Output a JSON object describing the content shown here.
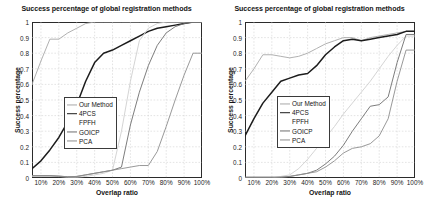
{
  "figure": {
    "panel_count": 2,
    "background_color": "#ffffff"
  },
  "axis": {
    "y_ticks": [
      "0",
      "0.1",
      "0.2",
      "0.3",
      "0.4",
      "0.5",
      "0.6",
      "0.7",
      "0.8",
      "0.9",
      "1"
    ],
    "x_ticks": [
      "10%",
      "20%",
      "30%",
      "40%",
      "50%",
      "60%",
      "70%",
      "80%",
      "90%",
      "100%"
    ],
    "ylabel": "Success percentage",
    "xlabel": "Overlap ratio"
  },
  "legend": {
    "entries": [
      {
        "label": "Our Method",
        "color": "#a8a8a8",
        "width": 1.1,
        "show_line": true
      },
      {
        "label": "4PCS",
        "color": "#1c1c1c",
        "width": 1.6,
        "show_line": true
      },
      {
        "label": "FPFH",
        "color": "#cfcfcf",
        "width": 1.1,
        "show_line": false
      },
      {
        "label": "GOICP",
        "color": "#6e6e6e",
        "width": 1.1,
        "show_line": true
      },
      {
        "label": "PCA",
        "color": "#8d8d8d",
        "width": 1.1,
        "show_line": true
      }
    ]
  },
  "chart_data": [
    {
      "type": "line",
      "panel": "left",
      "title": "Success percentage of global registration methods",
      "xlabel": "Overlap ratio",
      "ylabel": "Success percentage",
      "xlim": [
        5,
        100
      ],
      "ylim": [
        0,
        1
      ],
      "x": [
        5,
        10,
        15,
        20,
        25,
        30,
        35,
        40,
        45,
        50,
        55,
        60,
        65,
        70,
        75,
        80,
        85,
        90,
        95,
        100
      ],
      "grid": true,
      "legend_position": "center-left",
      "series": [
        {
          "name": "Our Method",
          "color": "#a8a8a8",
          "values": [
            0.6,
            0.75,
            0.89,
            0.89,
            0.93,
            0.96,
            0.99,
            1.0,
            1.0,
            1.0,
            1.0,
            1.0,
            1.0,
            1.0,
            1.0,
            1.0,
            1.0,
            1.0,
            1.0,
            1.0
          ]
        },
        {
          "name": "4PCS",
          "color": "#1c1c1c",
          "values": [
            0.06,
            0.11,
            0.18,
            0.26,
            0.36,
            0.47,
            0.62,
            0.74,
            0.8,
            0.82,
            0.85,
            0.88,
            0.91,
            0.94,
            0.96,
            0.97,
            0.98,
            0.99,
            1.0,
            1.0
          ]
        },
        {
          "name": "FPFH",
          "color": "#cfcfcf",
          "values": [
            0.01,
            0.01,
            0.01,
            0.01,
            0.005,
            0.005,
            0.01,
            0.02,
            0.03,
            0.05,
            0.3,
            0.62,
            0.88,
            0.96,
            0.99,
            1.0,
            1.0,
            1.0,
            1.0,
            1.0
          ]
        },
        {
          "name": "GOICP",
          "color": "#6e6e6e",
          "values": [
            0.015,
            0.015,
            0.015,
            0.012,
            0.008,
            0.01,
            0.02,
            0.03,
            0.04,
            0.05,
            0.07,
            0.34,
            0.55,
            0.72,
            0.85,
            0.93,
            0.97,
            0.99,
            1.0,
            1.0
          ]
        },
        {
          "name": "PCA",
          "color": "#8d8d8d",
          "values": [
            0.015,
            0.015,
            0.015,
            0.012,
            0.008,
            0.01,
            0.02,
            0.03,
            0.04,
            0.05,
            0.06,
            0.07,
            0.08,
            0.08,
            0.17,
            0.33,
            0.5,
            0.66,
            0.8,
            0.8
          ]
        }
      ]
    },
    {
      "type": "line",
      "panel": "right",
      "title": "Success percentage of global registration methods",
      "xlabel": "Overlap ratio",
      "ylabel": "Success percentage",
      "xlim": [
        5,
        100
      ],
      "ylim": [
        0,
        1
      ],
      "x": [
        5,
        10,
        15,
        20,
        25,
        30,
        35,
        40,
        45,
        50,
        55,
        60,
        65,
        70,
        75,
        80,
        85,
        90,
        95,
        100
      ],
      "grid": true,
      "legend_position": "center-left",
      "series": [
        {
          "name": "Our Method",
          "color": "#a8a8a8",
          "values": [
            0.62,
            0.7,
            0.79,
            0.79,
            0.78,
            0.77,
            0.78,
            0.8,
            0.83,
            0.86,
            0.88,
            0.9,
            0.9,
            0.88,
            0.9,
            0.91,
            0.92,
            0.93,
            0.94,
            0.94
          ]
        },
        {
          "name": "4PCS",
          "color": "#1c1c1c",
          "values": [
            0.27,
            0.38,
            0.48,
            0.55,
            0.62,
            0.64,
            0.66,
            0.67,
            0.72,
            0.79,
            0.84,
            0.88,
            0.89,
            0.88,
            0.89,
            0.9,
            0.91,
            0.92,
            0.94,
            0.94
          ]
        },
        {
          "name": "FPFH",
          "color": "#cfcfcf",
          "values": [
            0.0,
            0.0,
            0.0,
            0.0,
            0.01,
            0.02,
            0.06,
            0.12,
            0.19,
            0.26,
            0.33,
            0.41,
            0.48,
            0.55,
            0.62,
            0.7,
            0.78,
            0.85,
            0.91,
            0.91
          ]
        },
        {
          "name": "GOICP",
          "color": "#6e6e6e",
          "values": [
            0.005,
            0.005,
            0.005,
            0.005,
            0.005,
            0.01,
            0.02,
            0.03,
            0.05,
            0.09,
            0.14,
            0.21,
            0.3,
            0.38,
            0.46,
            0.47,
            0.52,
            0.74,
            0.92,
            0.92
          ]
        },
        {
          "name": "PCA",
          "color": "#8d8d8d",
          "values": [
            0.005,
            0.005,
            0.005,
            0.005,
            0.005,
            0.01,
            0.02,
            0.03,
            0.04,
            0.07,
            0.11,
            0.16,
            0.19,
            0.2,
            0.22,
            0.27,
            0.38,
            0.62,
            0.82,
            0.82
          ]
        }
      ]
    }
  ]
}
